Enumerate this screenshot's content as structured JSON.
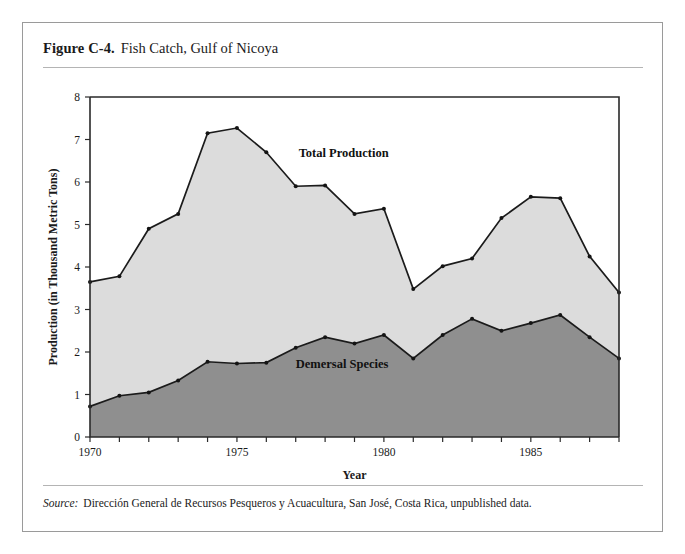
{
  "figure": {
    "label": "Figure C-4.",
    "title": "Fish Catch, Gulf of Nicoya"
  },
  "source": {
    "label": "Source:",
    "text": "Dirección General de Recursos Pesqueros y Acuacultura, San José, Costa Rica, unpublished data."
  },
  "colors": {
    "total_area": "#dcdcdc",
    "demersal_area": "#8f8f8f",
    "line": "#1b1b1b",
    "axis": "#2a2a2a",
    "rule": "#b4b4b4",
    "card_border": "#9a9a9a"
  },
  "chart_data": {
    "type": "area",
    "title": "Fish Catch, Gulf of Nicoya",
    "xlabel": "Year",
    "ylabel": "Production (in Thousand Metric Tons)",
    "xlim": [
      1970,
      1988
    ],
    "ylim": [
      0,
      8
    ],
    "grid": false,
    "legend_position": "inline-annotations",
    "stacked": false,
    "x": [
      1970,
      1971,
      1972,
      1973,
      1974,
      1975,
      1976,
      1977,
      1978,
      1979,
      1980,
      1981,
      1982,
      1983,
      1984,
      1985,
      1986,
      1987,
      1988
    ],
    "xticks": [
      1970,
      1971,
      1972,
      1973,
      1974,
      1975,
      1976,
      1977,
      1978,
      1979,
      1980,
      1981,
      1982,
      1983,
      1984,
      1985,
      1986,
      1987,
      1988
    ],
    "xticklabels": [
      "1970",
      "",
      "",
      "",
      "",
      "1975",
      "",
      "",
      "",
      "",
      "1980",
      "",
      "",
      "",
      "",
      "1985",
      "",
      "",
      ""
    ],
    "yticks": [
      0,
      1,
      2,
      3,
      4,
      5,
      6,
      7,
      8
    ],
    "yticklabels": [
      "0",
      "1",
      "2",
      "3",
      "4",
      "5",
      "6",
      "7",
      "8"
    ],
    "series": [
      {
        "name": "Total Production",
        "label_x": 1977.1,
        "label_y": 6.6,
        "fill": "#dcdcdc",
        "values": [
          3.65,
          3.78,
          4.9,
          5.25,
          7.15,
          7.27,
          6.7,
          5.9,
          5.92,
          5.25,
          5.37,
          3.48,
          4.02,
          4.2,
          5.15,
          5.65,
          5.62,
          4.25,
          3.4
        ]
      },
      {
        "name": "Demersal Species",
        "label_x": 1977.0,
        "label_y": 1.63,
        "fill": "#8f8f8f",
        "values": [
          0.72,
          0.97,
          1.05,
          1.33,
          1.77,
          1.73,
          1.75,
          2.1,
          2.35,
          2.2,
          2.4,
          1.85,
          2.4,
          2.78,
          2.5,
          2.68,
          2.87,
          2.35,
          1.85
        ]
      }
    ]
  }
}
